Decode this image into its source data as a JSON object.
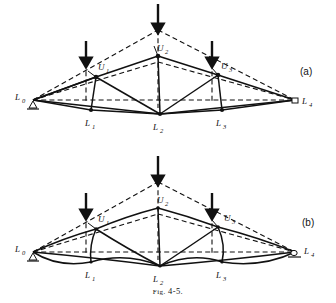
{
  "figure": {
    "caption_prefix": "Fig.",
    "caption_number": "4-5.",
    "caption_full": "FIG. 4-5."
  },
  "panels": [
    {
      "id": "a",
      "label": "(a)",
      "description": "Truss with straight members shown deflected against dashed undeformed outline",
      "member_style": "straight",
      "nodes": [
        {
          "name": "L0",
          "label_main": "L",
          "label_sub": "0",
          "x": 33,
          "y": 100,
          "support": "pin"
        },
        {
          "name": "L1",
          "label_main": "L",
          "label_sub": "1",
          "x": 91,
          "y": 110,
          "support": "none"
        },
        {
          "name": "L2",
          "label_main": "L",
          "label_sub": "2",
          "x": 160,
          "y": 114,
          "support": "none"
        },
        {
          "name": "L3",
          "label_main": "L",
          "label_sub": "3",
          "x": 222,
          "y": 110,
          "support": "none"
        },
        {
          "name": "L4",
          "label_main": "L",
          "label_sub": "4",
          "x": 295,
          "y": 100,
          "support": "roller"
        },
        {
          "name": "U1",
          "label_main": "U",
          "label_sub": "1",
          "x": 96,
          "y": 77,
          "support": "none"
        },
        {
          "name": "U2",
          "label_main": "U",
          "label_sub": "2",
          "x": 158,
          "y": 56,
          "support": "none"
        },
        {
          "name": "U3",
          "label_main": "U",
          "label_sub": "3",
          "x": 218,
          "y": 75,
          "support": "none"
        }
      ],
      "loads": [
        {
          "name": "load-arrow-u1",
          "x": 86,
          "y_top": 41,
          "y_bottom": 64
        },
        {
          "name": "load-arrow-u2",
          "x": 158,
          "y_top": 4,
          "y_bottom": 30
        },
        {
          "name": "load-arrow-u3",
          "x": 212,
          "y_top": 41,
          "y_bottom": 64
        }
      ],
      "undeformed_apex": {
        "x": 158,
        "y": 30
      },
      "undeformed_u1": {
        "x": 86,
        "y": 63
      },
      "undeformed_u3": {
        "x": 212,
        "y": 63
      }
    },
    {
      "id": "b",
      "label": "(b)",
      "description": "Same truss with curved members indicating flexural bending deformation",
      "member_style": "curved",
      "nodes": [
        {
          "name": "L0",
          "label_main": "L",
          "label_sub": "0",
          "x": 33,
          "y": 252,
          "support": "pin"
        },
        {
          "name": "L1",
          "label_main": "L",
          "label_sub": "1",
          "x": 91,
          "y": 262,
          "support": "none"
        },
        {
          "name": "L2",
          "label_main": "L",
          "label_sub": "2",
          "x": 160,
          "y": 266,
          "support": "none"
        },
        {
          "name": "L3",
          "label_main": "L",
          "label_sub": "3",
          "x": 222,
          "y": 262,
          "support": "none"
        },
        {
          "name": "L4",
          "label_main": "L",
          "label_sub": "4",
          "x": 295,
          "y": 252,
          "support": "roller"
        },
        {
          "name": "U1",
          "label_main": "U",
          "label_sub": "1",
          "x": 96,
          "y": 229,
          "support": "none"
        },
        {
          "name": "U2",
          "label_main": "U",
          "label_sub": "2",
          "x": 158,
          "y": 208,
          "support": "none"
        },
        {
          "name": "U3",
          "label_main": "U",
          "label_sub": "3",
          "x": 218,
          "y": 227,
          "support": "none"
        }
      ],
      "loads": [
        {
          "name": "load-arrow-u1",
          "x": 86,
          "y_top": 193,
          "y_bottom": 216
        },
        {
          "name": "load-arrow-u2",
          "x": 158,
          "y_top": 156,
          "y_bottom": 182
        },
        {
          "name": "load-arrow-u3",
          "x": 212,
          "y_top": 193,
          "y_bottom": 216
        }
      ],
      "undeformed_apex": {
        "x": 158,
        "y": 182
      },
      "undeformed_u1": {
        "x": 86,
        "y": 215
      },
      "undeformed_u3": {
        "x": 212,
        "y": 215
      }
    }
  ],
  "colors": {
    "ink": "#111111",
    "paper": "#ffffff"
  }
}
